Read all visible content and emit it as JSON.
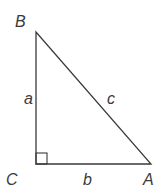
{
  "diagram": {
    "type": "right-triangle",
    "vertices": {
      "B": {
        "label": "B"
      },
      "C": {
        "label": "C"
      },
      "A": {
        "label": "A"
      }
    },
    "sides": {
      "a": {
        "label": "a",
        "between": [
          "B",
          "C"
        ]
      },
      "b": {
        "label": "b",
        "between": [
          "C",
          "A"
        ]
      },
      "c": {
        "label": "c",
        "between": [
          "B",
          "A"
        ]
      }
    },
    "right_angle_at": "C",
    "colors": {
      "stroke": "#3a3a3a",
      "background": "#ffffff"
    }
  }
}
